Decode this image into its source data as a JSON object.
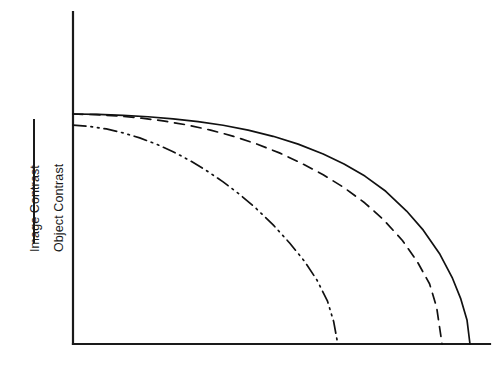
{
  "figure": {
    "width": 498,
    "height": 366,
    "background": "#ffffff",
    "ink_color": "#1a1a1a"
  },
  "axis_label": {
    "numerator": "Image Contrast",
    "denominator": "Object Contrast",
    "fraction_bar": "horizontal-rule"
  },
  "chart_data": {
    "type": "line",
    "title": "",
    "subtitle": "",
    "xlabel": "",
    "ylabel": "Image Contrast / Object Contrast",
    "xlabel_ticks": [],
    "ylabel_ticks": [],
    "grid": false,
    "legend": false,
    "legend_position": "none",
    "xlim": [
      0,
      1
    ],
    "ylim": [
      0,
      1
    ],
    "axes_style": "open-L-frame (left spine and bottom spine only, no ticks, no tick labels)",
    "annotations": [],
    "series": [
      {
        "name": "solid curve",
        "style": "solid",
        "color": "#111111",
        "plateau_value": 1.0,
        "cutoff_x": 0.952,
        "x": [
          0.0,
          0.06,
          0.12,
          0.18,
          0.24,
          0.3,
          0.36,
          0.42,
          0.48,
          0.54,
          0.6,
          0.65,
          0.7,
          0.75,
          0.8,
          0.84,
          0.88,
          0.91,
          0.93,
          0.945,
          0.952
        ],
        "y": [
          1.0,
          0.998,
          0.994,
          0.988,
          0.979,
          0.967,
          0.951,
          0.93,
          0.903,
          0.869,
          0.826,
          0.783,
          0.73,
          0.664,
          0.578,
          0.495,
          0.39,
          0.286,
          0.196,
          0.103,
          0.0
        ]
      },
      {
        "name": "dashed curve",
        "style": "dashed",
        "color": "#111111",
        "plateau_value": 1.0,
        "cutoff_x": 0.885,
        "x": [
          0.0,
          0.055,
          0.11,
          0.165,
          0.22,
          0.275,
          0.33,
          0.385,
          0.44,
          0.495,
          0.55,
          0.6,
          0.65,
          0.7,
          0.745,
          0.79,
          0.825,
          0.855,
          0.872,
          0.885
        ],
        "y": [
          1.0,
          0.997,
          0.991,
          0.982,
          0.969,
          0.952,
          0.93,
          0.903,
          0.87,
          0.831,
          0.784,
          0.736,
          0.68,
          0.613,
          0.54,
          0.45,
          0.36,
          0.262,
          0.16,
          0.0
        ]
      },
      {
        "name": "dash-dot-dot curve",
        "style": "dash-dot-dot",
        "color": "#111111",
        "plateau_value": 0.952,
        "cutoff_x": 0.635,
        "x": [
          0.0,
          0.04,
          0.08,
          0.12,
          0.16,
          0.2,
          0.24,
          0.28,
          0.32,
          0.36,
          0.4,
          0.44,
          0.48,
          0.52,
          0.555,
          0.585,
          0.61,
          0.625,
          0.635
        ],
        "y": [
          0.952,
          0.946,
          0.935,
          0.918,
          0.896,
          0.869,
          0.836,
          0.798,
          0.754,
          0.705,
          0.65,
          0.588,
          0.518,
          0.438,
          0.36,
          0.278,
          0.188,
          0.098,
          0.0
        ]
      }
    ]
  },
  "geometry": {
    "origin_px": [
      73,
      344
    ],
    "y_axis_top_px": 12,
    "x_axis_right_px": 490,
    "plot_top_value_px": 114,
    "dashdot_start_px": 125
  }
}
